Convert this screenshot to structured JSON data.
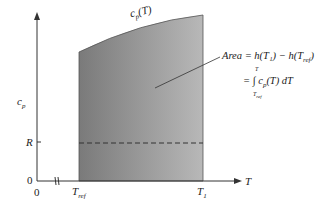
{
  "diagram": {
    "y_axis_label": "c",
    "y_axis_label_sub": "p",
    "x_axis_label": "T",
    "origin_y_tick": "0",
    "origin_x_tick": "0",
    "r_tick": "R",
    "t_ref_main": "T",
    "t_ref_sub": "ref",
    "t1_main": "T",
    "t1_sub": "1",
    "curve_label_main": "c",
    "curve_label_sub": "p",
    "curve_label_arg": "(T)",
    "area_line1": "Area = h(T₁) − h(T",
    "area_line1_sub": "ref",
    "area_line1_end": ")",
    "area_line2": "= ∫ c",
    "area_line2_sub": "p",
    "area_line2_end": "(T) dT",
    "integral_upper": "T",
    "integral_lower": "T",
    "integral_lower_sub": "ref",
    "colors": {
      "fill_dark": "#7a7a7a",
      "fill_light": "#b4b4b4",
      "axis": "#333333",
      "dashed": "#333333"
    }
  }
}
